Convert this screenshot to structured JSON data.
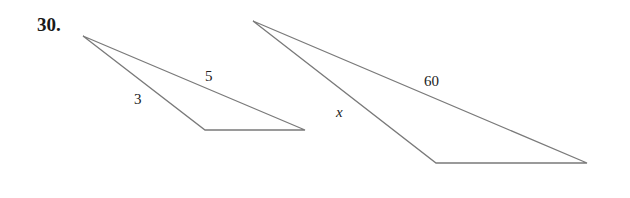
{
  "problem": {
    "number": "30."
  },
  "figure": {
    "stroke_color": "#7a7a7a",
    "small_triangle": {
      "vertices": [
        [
          83,
          36
        ],
        [
          205,
          130
        ],
        [
          305,
          130
        ]
      ],
      "side_labels": [
        {
          "text": "3",
          "x": 134,
          "y": 104
        },
        {
          "text": "5",
          "x": 205,
          "y": 81
        }
      ]
    },
    "large_triangle": {
      "vertices": [
        [
          253,
          21
        ],
        [
          436,
          163
        ],
        [
          587,
          163
        ]
      ],
      "side_labels": [
        {
          "text": "60",
          "x": 424,
          "y": 86
        },
        {
          "text": "x",
          "x": 336,
          "y": 117
        }
      ]
    }
  }
}
